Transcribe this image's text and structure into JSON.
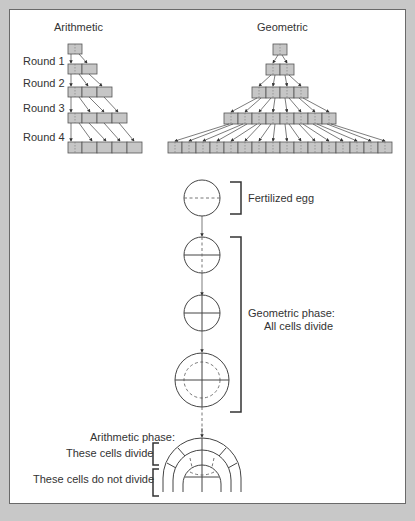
{
  "top": {
    "arithmetic": {
      "title": "Arithmetic",
      "rounds": [
        {
          "label": "Round 1",
          "cells": 2
        },
        {
          "label": "Round 2",
          "cells": 3
        },
        {
          "label": "Round 3",
          "cells": 4
        },
        {
          "label": "Round 4",
          "cells": 5
        }
      ],
      "start_cells": 1
    },
    "geometric": {
      "title": "Geometric",
      "rows": [
        1,
        2,
        4,
        8,
        16
      ]
    }
  },
  "bottom": {
    "fertilized_egg_label": "Fertilized egg",
    "geometric_phase_label_line1": "Geometric phase:",
    "geometric_phase_label_line2": "All cells divide",
    "arithmetic_phase_label": "Arithmetic phase:",
    "these_cells_divide_label": "These cells divide",
    "these_cells_do_not_divide_label": "These cells do not divide"
  },
  "colors": {
    "background": "#c8c8c8",
    "panel": "#ffffff",
    "cell_fill": "#c6c6c6",
    "stroke": "#444444"
  }
}
